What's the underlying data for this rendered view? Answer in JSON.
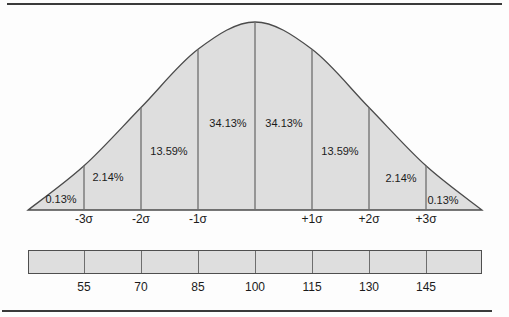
{
  "chart_data": {
    "type": "area",
    "curve": {
      "segments": [
        {
          "label": "0.13%",
          "value": 0.13
        },
        {
          "label": "2.14%",
          "value": 2.14
        },
        {
          "label": "13.59%",
          "value": 13.59
        },
        {
          "label": "34.13%",
          "value": 34.13
        },
        {
          "label": "34.13%",
          "value": 34.13
        },
        {
          "label": "13.59%",
          "value": 13.59
        },
        {
          "label": "2.14%",
          "value": 2.14
        },
        {
          "label": "0.13%",
          "value": 0.13
        }
      ],
      "sigma_axis_labels": [
        "-3σ",
        "-2σ",
        "-1σ",
        "+1σ",
        "+2σ",
        "+3σ"
      ]
    },
    "iq_scale": {
      "ticks": [
        55,
        70,
        85,
        100,
        115,
        130,
        145
      ]
    },
    "colors": {
      "fill": "#dedede",
      "curve_stroke": "#4b4b4b",
      "divider": "#6e6e6e",
      "text": "#1b1b1b",
      "rule": "#3a3a3a"
    },
    "layout_hints": {
      "center_x": 255,
      "sigma_px": 57,
      "baseline_y": 210,
      "peak_y": 22,
      "profile": [
        [
          -3.98,
          0
        ],
        [
          -3,
          0.235
        ],
        [
          -2,
          0.545
        ],
        [
          -1,
          0.855
        ],
        [
          0,
          1
        ],
        [
          1,
          0.855
        ],
        [
          2,
          0.545
        ],
        [
          3,
          0.235
        ],
        [
          3.98,
          0
        ]
      ]
    }
  }
}
